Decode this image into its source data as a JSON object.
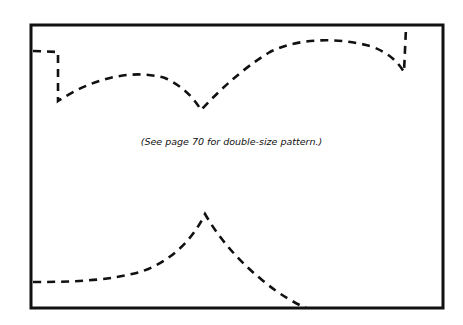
{
  "caption": "(See page 70 for double-size pattern.)",
  "colors": {
    "ink": "#111111",
    "paper": "#ffffff"
  }
}
